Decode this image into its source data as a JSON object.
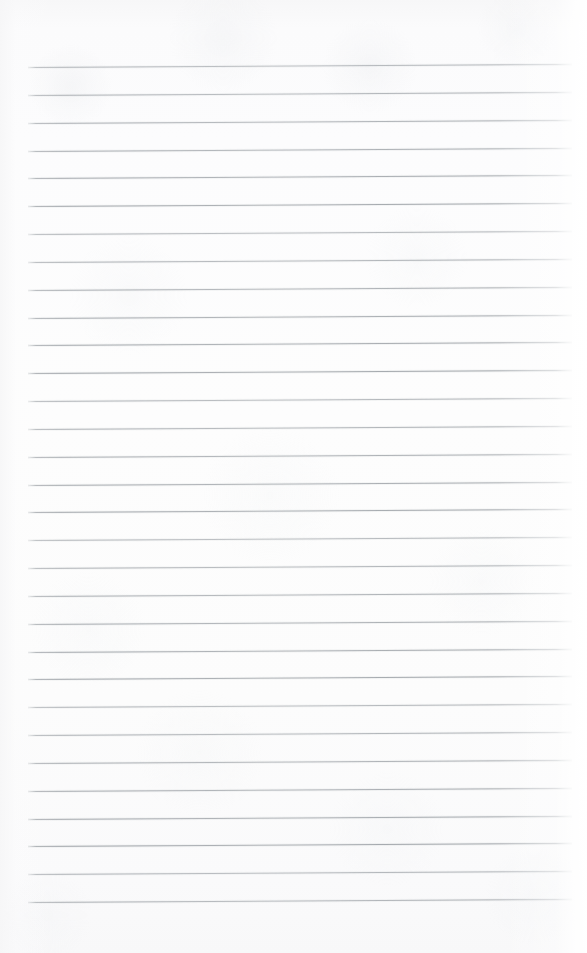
{
  "document": {
    "kind": "scanned-ruled-notebook-page",
    "title": "Blank Ruled Notebook Page",
    "page_width": 587,
    "page_height": 953,
    "orientation": "portrait",
    "content_text": "",
    "handwriting_present": "no",
    "printed_text_present": "no"
  },
  "paper": {
    "background_color": "#fdfdfd",
    "edge_tint_color": "#f7f7f8",
    "grain_color": "#eceef0",
    "right_edge_highlight_color": "#ffffff"
  },
  "ruling": {
    "line_color": "#9ea2a8",
    "line_color_light": "#c2c6ca",
    "line_thickness_px": 1,
    "line_count": 31,
    "left_margin_x": 28,
    "right_margin_x": 572,
    "first_line_y": 67,
    "line_spacing_px": 27.8,
    "slant_degrees": -0.35,
    "has_vertical_margin_rule": "no",
    "has_holes": "no"
  },
  "chart_data": {
    "type": "table",
    "xlabel": "x start / x end (px)",
    "ylabel": "y (px)",
    "columns": [
      "line",
      "y_left",
      "y_right",
      "x_start",
      "x_end"
    ],
    "rows": [
      [
        1,
        67,
        64,
        28,
        572
      ],
      [
        2,
        95,
        92,
        28,
        572
      ],
      [
        3,
        123,
        120,
        28,
        572
      ],
      [
        4,
        151,
        148,
        28,
        572
      ],
      [
        5,
        178,
        175,
        28,
        572
      ],
      [
        6,
        206,
        203,
        28,
        572
      ],
      [
        7,
        234,
        231,
        28,
        572
      ],
      [
        8,
        262,
        259,
        28,
        572
      ],
      [
        9,
        290,
        287,
        28,
        572
      ],
      [
        10,
        318,
        315,
        28,
        572
      ],
      [
        11,
        345,
        342,
        28,
        572
      ],
      [
        12,
        373,
        370,
        28,
        572
      ],
      [
        13,
        401,
        398,
        28,
        572
      ],
      [
        14,
        429,
        426,
        28,
        572
      ],
      [
        15,
        457,
        454,
        28,
        572
      ],
      [
        16,
        485,
        482,
        28,
        572
      ],
      [
        17,
        512,
        509,
        28,
        572
      ],
      [
        18,
        540,
        537,
        28,
        572
      ],
      [
        19,
        568,
        565,
        28,
        572
      ],
      [
        20,
        596,
        593,
        28,
        572
      ],
      [
        21,
        624,
        621,
        28,
        572
      ],
      [
        22,
        652,
        649,
        28,
        572
      ],
      [
        23,
        679,
        676,
        28,
        572
      ],
      [
        24,
        707,
        704,
        28,
        572
      ],
      [
        25,
        735,
        732,
        28,
        572
      ],
      [
        26,
        763,
        760,
        28,
        572
      ],
      [
        27,
        791,
        788,
        28,
        572
      ],
      [
        28,
        819,
        816,
        28,
        572
      ],
      [
        29,
        846,
        843,
        28,
        572
      ],
      [
        30,
        874,
        871,
        28,
        572
      ],
      [
        31,
        902,
        899,
        28,
        572
      ]
    ]
  }
}
